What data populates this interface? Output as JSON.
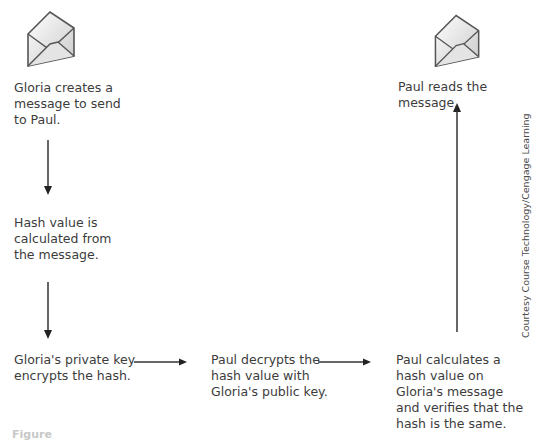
{
  "diagram": {
    "steps": {
      "gloria_creates": "Gloria creates a message to send to Paul.",
      "hash_calculated": "Hash value is calculated from the message.",
      "private_key_encrypts": "Gloria's private key encrypts the hash.",
      "paul_decrypts": "Paul decrypts the hash value with Gloria's  public key.",
      "paul_calculates": "Paul calculates a hash value on Gloria's message and verifies that the hash is the same.",
      "paul_reads": "Paul reads the message."
    },
    "lines": {
      "gloria_creates": [
        "Gloria creates a",
        "message to send",
        "to Paul."
      ],
      "hash_calculated": [
        "Hash value is",
        "calculated from",
        "the message."
      ],
      "private_key_encrypts": [
        "Gloria's private key",
        "encrypts the hash."
      ],
      "paul_decrypts": [
        "Paul decrypts the",
        "hash value with",
        "Gloria's  public key."
      ],
      "paul_calculates": [
        "Paul calculates a",
        "hash value on",
        "Gloria's message",
        "and verifies that the",
        "hash is the same."
      ],
      "paul_reads": [
        "Paul reads the message."
      ]
    },
    "icons": [
      "envelope-icon",
      "envelope-icon"
    ],
    "credit": "Courtesy Course Technology/Cengage Learning",
    "caption": "Figure"
  }
}
